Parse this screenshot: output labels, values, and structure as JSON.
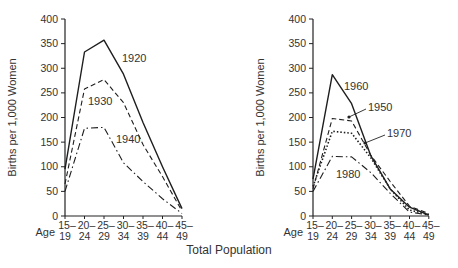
{
  "footer_title": "Total Population",
  "chart_data": [
    {
      "type": "line",
      "title": "",
      "xlabel": "Age",
      "ylabel": "Births per 1,000 Women",
      "ylim": [
        0,
        400
      ],
      "yticks": [
        0,
        50,
        100,
        150,
        200,
        250,
        300,
        350,
        400
      ],
      "categories": [
        "15–19",
        "20–24",
        "25–29",
        "30–34",
        "35–39",
        "40–44",
        "45–49"
      ],
      "series": [
        {
          "name": "1920",
          "style": "solid",
          "values": [
            95,
            333,
            357,
            288,
            190,
            100,
            15
          ]
        },
        {
          "name": "1930",
          "style": "dashed",
          "values": [
            65,
            258,
            277,
            230,
            145,
            80,
            10
          ]
        },
        {
          "name": "1940",
          "style": "dash-dot",
          "values": [
            50,
            178,
            180,
            108,
            70,
            35,
            5
          ]
        }
      ],
      "grid": false
    },
    {
      "type": "line",
      "title": "",
      "xlabel": "Age",
      "ylabel": "Births per 1,000 Women",
      "ylim": [
        0,
        400
      ],
      "yticks": [
        0,
        50,
        100,
        150,
        200,
        250,
        300,
        350,
        400
      ],
      "categories": [
        "15–19",
        "20–24",
        "25–29",
        "30–34",
        "35–39",
        "40–44",
        "45–49"
      ],
      "series": [
        {
          "name": "1950",
          "style": "dashed",
          "values": [
            55,
            198,
            193,
            123,
            70,
            20,
            5
          ]
        },
        {
          "name": "1960",
          "style": "solid",
          "values": [
            75,
            287,
            228,
            122,
            55,
            18,
            2
          ]
        },
        {
          "name": "1970",
          "style": "dotted",
          "values": [
            60,
            172,
            168,
            118,
            55,
            12,
            3
          ]
        },
        {
          "name": "1980",
          "style": "dash-dot",
          "values": [
            50,
            121,
            120,
            88,
            46,
            8,
            2
          ]
        }
      ],
      "grid": false
    }
  ]
}
